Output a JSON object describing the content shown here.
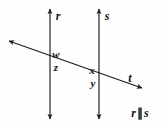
{
  "figure": {
    "background_color": "#fefefe",
    "stroke_color": "#1a1a1a",
    "text_color": "#141414"
  },
  "lines": [
    {
      "id": "line-r",
      "name": "r",
      "kind": "vertical",
      "label_x": 58,
      "label_y": 16,
      "x1": 50,
      "y1": 9,
      "x2": 50,
      "y2": 119,
      "arrow_start": true,
      "arrow_end": true
    },
    {
      "id": "line-s",
      "name": "s",
      "kind": "vertical",
      "label_x": 107,
      "label_y": 16,
      "x1": 99,
      "y1": 9,
      "x2": 99,
      "y2": 119,
      "arrow_start": true,
      "arrow_end": true
    },
    {
      "id": "line-t",
      "name": "t",
      "kind": "transversal",
      "label_x": 130,
      "label_y": 78,
      "x1": 9,
      "y1": 41,
      "x2": 142,
      "y2": 88,
      "arrow_start": true,
      "arrow_end": true
    }
  ],
  "intersections": [
    {
      "id": "intersection-r-t",
      "x": 50,
      "y": 55
    },
    {
      "id": "intersection-s-t",
      "x": 99,
      "y": 72
    }
  ],
  "angles": [
    {
      "id": "angle-w",
      "name": "w",
      "x": 56,
      "y": 54,
      "position": "above-left-intersection"
    },
    {
      "id": "angle-z",
      "name": "z",
      "x": 56,
      "y": 67,
      "position": "below-left-intersection"
    },
    {
      "id": "angle-x",
      "name": "x",
      "x": 92,
      "y": 70,
      "position": "above-right-intersection"
    },
    {
      "id": "angle-y",
      "name": "y",
      "x": 93,
      "y": 83,
      "position": "below-right-intersection"
    }
  ],
  "relation": {
    "left_line": "r",
    "symbol": "∥",
    "right_line": "s",
    "x": 140,
    "y": 113
  }
}
